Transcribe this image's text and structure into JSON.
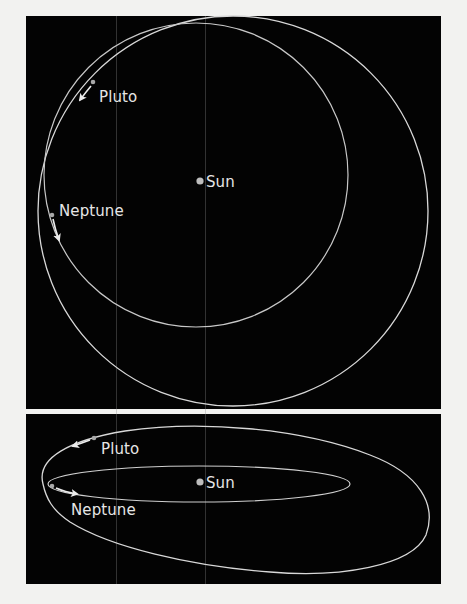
{
  "colors": {
    "background": "#f2f2f0",
    "panel": "#030303",
    "orbit": "#d8d8d8",
    "text": "#e6e6e6",
    "planet": "#b0b0b0"
  },
  "top_view": {
    "labels": {
      "pluto": "Pluto",
      "neptune": "Neptune",
      "sun": "Sun"
    }
  },
  "side_view": {
    "labels": {
      "pluto": "Pluto",
      "neptune": "Neptune",
      "sun": "Sun"
    }
  }
}
